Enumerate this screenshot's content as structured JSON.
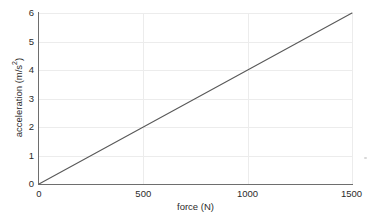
{
  "chart_data": {
    "type": "line",
    "title": "",
    "subtitle": "",
    "xlabel": "force (N)",
    "ylabel": "acceleration (m/s²)",
    "ylabel_base": "acceleration (m/s",
    "ylabel_exponent": "2",
    "ylabel_close": ")",
    "xlim": [
      0,
      1500
    ],
    "ylim": [
      0,
      6
    ],
    "xticks": [
      0,
      500,
      1000,
      1500
    ],
    "xtick_labels": [
      "0",
      "500",
      "1000",
      "1500"
    ],
    "yticks": [
      0,
      1,
      2,
      3,
      4,
      5,
      6
    ],
    "ytick_labels": [
      "0",
      "1",
      "2",
      "3",
      "4",
      "5",
      "6"
    ],
    "grid": true,
    "grid_color": "#ececec",
    "legend": null,
    "legend_position": "none",
    "line_color": "#595959",
    "axis_color": "#6e6e6e",
    "background_color": "#ffffff",
    "series": [
      {
        "name": "acceleration vs force",
        "x": [
          0,
          250,
          500,
          750,
          1000,
          1250,
          1500
        ],
        "y": [
          0,
          1,
          2,
          3,
          4,
          5,
          6
        ]
      }
    ],
    "slope": 0.004,
    "intercept": 0,
    "annotations": []
  },
  "figure": {
    "name": "acceleration-vs-force-plot"
  }
}
